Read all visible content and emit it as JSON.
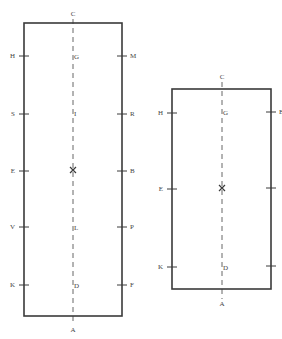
{
  "diagram": {
    "left_box": {
      "rect": {
        "x": 24,
        "y": 23,
        "w": 98,
        "h": 293
      },
      "center_x": 73,
      "center_top_label": {
        "text": "C",
        "x": 73,
        "y": 14
      },
      "center_bottom_label": {
        "text": "A",
        "x": 73,
        "y": 330
      },
      "center_cross": {
        "x": 73,
        "y": 170
      },
      "center_labels": [
        {
          "text": "G",
          "y": 57
        },
        {
          "text": "I",
          "y": 114
        },
        {
          "text": "L",
          "y": 228
        },
        {
          "text": "D",
          "y": 286
        }
      ],
      "left_ticks": [
        {
          "label": "H",
          "y": 56
        },
        {
          "label": "S",
          "y": 114
        },
        {
          "label": "E",
          "y": 171
        },
        {
          "label": "V",
          "y": 227
        },
        {
          "label": "K",
          "y": 285
        }
      ],
      "right_ticks": [
        {
          "label": "M",
          "y": 56
        },
        {
          "label": "R",
          "y": 114
        },
        {
          "label": "B",
          "y": 171
        },
        {
          "label": "P",
          "y": 227
        },
        {
          "label": "F",
          "y": 285
        }
      ]
    },
    "right_box": {
      "rect": {
        "x": 172,
        "y": 89,
        "w": 99,
        "h": 200
      },
      "center_x": 222,
      "center_top_label": {
        "text": "C",
        "x": 222,
        "y": 77
      },
      "center_bottom_label": {
        "text": "A",
        "x": 222,
        "y": 304
      },
      "center_cross": {
        "x": 222,
        "y": 188
      },
      "center_labels": [
        {
          "text": "G",
          "y": 113
        },
        {
          "text": "D",
          "y": 268
        }
      ],
      "left_ticks": [
        {
          "label": "H",
          "y": 113
        },
        {
          "label": "E",
          "y": 189
        },
        {
          "label": "K",
          "y": 267
        }
      ],
      "right_ticks": [
        {
          "label": "B",
          "y": 112
        },
        {
          "label": "",
          "y": 188
        },
        {
          "label": "",
          "y": 266
        }
      ]
    },
    "colors": {
      "stroke": "#3a3a3a",
      "dash": "#666666",
      "text": "#444444"
    }
  }
}
